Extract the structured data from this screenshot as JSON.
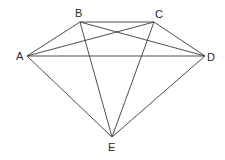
{
  "diagram": {
    "type": "graph",
    "vertices": [
      {
        "id": "A",
        "label": "A",
        "x": 27,
        "y": 56,
        "lx": 16,
        "ly": 60
      },
      {
        "id": "B",
        "label": "B",
        "x": 80,
        "y": 22,
        "lx": 75,
        "ly": 17
      },
      {
        "id": "C",
        "label": "C",
        "x": 154,
        "y": 22,
        "lx": 155,
        "ly": 18
      },
      {
        "id": "D",
        "label": "D",
        "x": 205,
        "y": 56,
        "lx": 207,
        "ly": 61
      },
      {
        "id": "E",
        "label": "E",
        "x": 112,
        "y": 137,
        "lx": 108,
        "ly": 151
      }
    ],
    "edges": [
      [
        "A",
        "B"
      ],
      [
        "A",
        "C"
      ],
      [
        "A",
        "D"
      ],
      [
        "A",
        "E"
      ],
      [
        "B",
        "C"
      ],
      [
        "B",
        "D"
      ],
      [
        "B",
        "E"
      ],
      [
        "C",
        "D"
      ],
      [
        "C",
        "E"
      ],
      [
        "D",
        "E"
      ]
    ]
  }
}
